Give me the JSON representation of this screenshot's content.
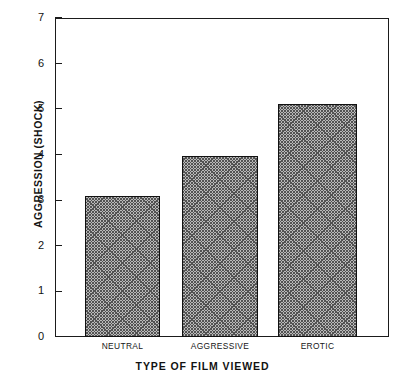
{
  "chart_data": {
    "type": "bar",
    "title": "",
    "categories": [
      "NEUTRAL",
      "AGGRESSIVE",
      "EROTIC"
    ],
    "values": [
      3.1,
      3.97,
      5.12
    ],
    "series": [
      {
        "name": "Aggression (shock)",
        "values": [
          3.1,
          3.97,
          5.12
        ]
      }
    ],
    "xlabel": "TYPE OF FILM VIEWED",
    "ylabel": "AGGRESSION (SHOCK)",
    "ylim": [
      0,
      7
    ],
    "yticks": [
      0,
      1,
      2,
      3,
      4,
      5,
      6,
      7
    ],
    "ytick_labels": [
      "0",
      "1",
      "2",
      "3",
      "4",
      "5",
      "6",
      "7"
    ],
    "grid": false,
    "legend": false,
    "bar_fill": "#b9b9b9",
    "bar_edge": "#111111",
    "frame_color": "#1b1b1b",
    "background": "#ffffff"
  },
  "axes": {
    "y_title": "AGGRESSION (SHOCK)",
    "x_title": "TYPE OF FILM VIEWED"
  }
}
